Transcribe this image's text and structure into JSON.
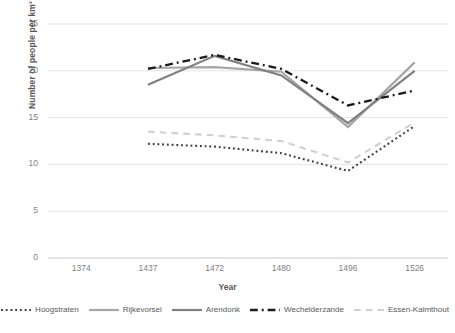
{
  "chart_data": {
    "type": "line",
    "title": "",
    "xlabel": "Year",
    "ylabel": "Number of people per km²",
    "categories": [
      "1374",
      "1437",
      "1472",
      "1480",
      "1496",
      "1526"
    ],
    "ylim": [
      0,
      25
    ],
    "yticks": [
      0,
      5,
      10,
      15,
      20,
      25
    ],
    "grid": "horizontal",
    "legend_position": "bottom",
    "series": [
      {
        "name": "Hoogstraten",
        "style": "dotted",
        "color": "#404040",
        "values": [
          null,
          12.2,
          11.9,
          11.2,
          9.3,
          14.1
        ]
      },
      {
        "name": "Rijkevorsel",
        "style": "solid",
        "color": "#a6a6a6",
        "values": [
          null,
          20.3,
          20.4,
          19.9,
          14.0,
          20.9
        ]
      },
      {
        "name": "Arendonk",
        "style": "solid",
        "color": "#808080",
        "values": [
          null,
          18.5,
          21.6,
          19.5,
          14.4,
          20.0
        ]
      },
      {
        "name": "Wechelderzande",
        "style": "dash-dot",
        "color": "#1a1a1a",
        "values": [
          null,
          20.2,
          21.7,
          20.2,
          16.3,
          17.9
        ]
      },
      {
        "name": "Essen-Kalmthout",
        "style": "dashed",
        "color": "#d0d0d0",
        "values": [
          null,
          13.5,
          13.1,
          12.5,
          10.2,
          14.5
        ]
      }
    ]
  },
  "axis": {
    "y_ticks": [
      "0",
      "5",
      "10",
      "15",
      "20",
      "25"
    ],
    "x_ticks": [
      "1374",
      "1437",
      "1472",
      "1480",
      "1496",
      "1526"
    ],
    "y_title": "Number of people per km²",
    "x_title": "Year"
  },
  "legend": {
    "items": [
      {
        "label": "Hoogstraten"
      },
      {
        "label": "Rijkevorsel"
      },
      {
        "label": "Arendonk"
      },
      {
        "label": "Wechelderzande"
      },
      {
        "label": "Essen-Kalmthout"
      }
    ]
  }
}
